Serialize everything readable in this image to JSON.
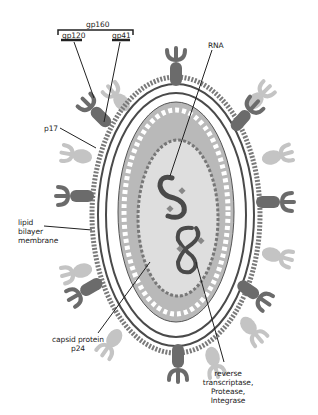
{
  "diagram": {
    "type": "labeled-structure",
    "labels": {
      "gp160": "gp160",
      "gp120": "gp120",
      "gp41": "gp41",
      "rna": "RNA",
      "p17": "p17",
      "lipid_line1": "lipid",
      "lipid_line2": "bilayer",
      "lipid_line3": "membrane",
      "capsid_line1": "capsid protein",
      "capsid_line2": "p24",
      "enzymes_line1": "reverse",
      "enzymes_line2": "transcriptase,",
      "enzymes_line3": "Protease,",
      "enzymes_line4": "Integrase"
    },
    "colors": {
      "dark_gray": "#6b6b6b",
      "light_gray": "#c4c4c4",
      "capsid_fill": "#b9b9b9",
      "core_fill": "#dedede",
      "line": "#333333"
    }
  }
}
